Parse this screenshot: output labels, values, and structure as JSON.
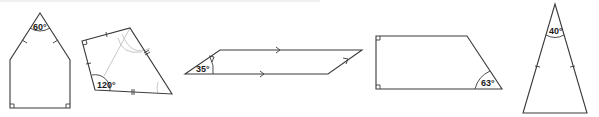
{
  "diagram": {
    "title": "",
    "colors": {
      "stroke": "#3a3a3a",
      "construction": "#c8c8c8",
      "label": "#1a1a1a",
      "background": "#ffffff"
    },
    "shapes": [
      {
        "id": "pentagon",
        "type": "pentagon",
        "angle_label": "60°",
        "marks": [
          "equal-length ticks on two sloping sides",
          "right angles at both bottom corners"
        ]
      },
      {
        "id": "kite",
        "type": "quadrilateral",
        "angle_label": "120°",
        "marks": [
          "single ticks on two adjacent sides",
          "double ticks on two adjacent sides",
          "right angle at top-left corner",
          "grey construction arcs"
        ]
      },
      {
        "id": "parallelogram",
        "type": "parallelogram",
        "angle_label": "35°",
        "marks": [
          "single arrows on top and bottom sides",
          "single arrows on slanted sides"
        ]
      },
      {
        "id": "trapezium",
        "type": "right trapezium",
        "angle_label": "63°",
        "marks": [
          "right angles at top-left and bottom-left corners"
        ]
      },
      {
        "id": "isosceles-triangle",
        "type": "isosceles triangle",
        "angle_label": "40°",
        "marks": [
          "equal-length ticks on two sloping sides"
        ]
      }
    ]
  }
}
